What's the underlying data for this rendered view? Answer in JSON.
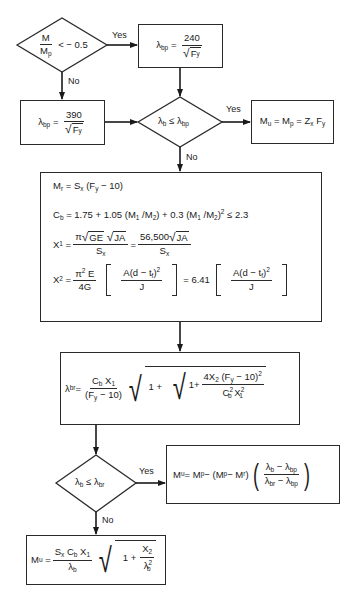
{
  "decisions": {
    "d1": {
      "lhs_num": "M",
      "lhs_den": "M",
      "lhs_den_sub": "p",
      "op": "< − 0.5",
      "yes": "Yes",
      "no": "No"
    },
    "d2": {
      "lhs": "λ",
      "lhs_sub": "b",
      "op": "≤",
      "rhs": "λ",
      "rhs_sub": "bp",
      "yes": "Yes",
      "no": "No"
    },
    "d3": {
      "lhs": "λ",
      "lhs_sub": "b",
      "op": "≤",
      "rhs": "λ",
      "rhs_sub": "br",
      "yes": "Yes",
      "no": "No"
    }
  },
  "boxes": {
    "lambda_bp_240": {
      "lhs": "λ",
      "lhs_sub": "bp",
      "eq": "=",
      "num": "240",
      "den_var": "F",
      "den_sub": "y"
    },
    "lambda_bp_390": {
      "lhs": "λ",
      "lhs_sub": "bp",
      "eq": "=",
      "num": "390",
      "den_var": "F",
      "den_sub": "y"
    },
    "mu_mp": {
      "text_a": "M",
      "sub_a": "u",
      "text_b": " = M",
      "sub_b": "p",
      "text_c": " = Z",
      "sub_c": "x",
      "text_d": " F",
      "sub_d": "y"
    },
    "big": {
      "mr": {
        "a": "M",
        "a_sub": "r",
        "b": " = S",
        "b_sub": "x",
        "c": "  (F",
        "c_sub": "y",
        "d": " − 10)"
      },
      "cb": {
        "a": "C",
        "a_sub": "b",
        "b": " = 1.75 + 1.05 (M",
        "s1": "1",
        "c": " /M",
        "s2": "2",
        "d": ") + 0.3 (M",
        "s3": "1",
        "e": " /M",
        "s4": "2",
        "f": ")",
        "sup": "2",
        "g": "  ≤  2.3"
      },
      "x1": {
        "lhs": "X",
        "lhs_sub": "1",
        "eq": "=",
        "num_pi": "π",
        "num_r1": "GE",
        "num_r2": "JA",
        "den": "S",
        "den_sub": "x",
        "eq2": "=",
        "num2": "56,500",
        "num2_r": "JA",
        "den2": "S",
        "den2_sub": "x"
      },
      "x2": {
        "lhs": "X",
        "lhs_sub": "2",
        "eq": "=",
        "num": "π",
        "num_sup": "2",
        "num_b": " E",
        "den": "4G",
        "inner_num_a": "A(d − t",
        "inner_num_sub": "f",
        "inner_num_b": ")",
        "inner_num_sup": "2",
        "inner_den": "J",
        "eq2": "= 6.41"
      }
    },
    "lambda_br": {
      "lhs": "λ",
      "lhs_sub": "br",
      "eq": "=",
      "num": "C",
      "num_sub": "b",
      "num_b": " X",
      "num_sub2": "1",
      "den": "(F",
      "den_sub": "y",
      "den_b": " − 10)",
      "one_plus": "1 +",
      "one_plus2": "1+",
      "in_num_a": "4X",
      "in_num_sub": "2",
      "in_num_b": " (F",
      "in_num_sub2": "y",
      "in_num_c": " − 10)",
      "in_num_sup": "2",
      "in_den_a": "C",
      "in_den_sup": "2",
      "in_den_sub": "b",
      "in_den_b": " X",
      "in_den_sup2": "2",
      "in_den_sub2": "1"
    },
    "mu_interp": {
      "a": "M",
      "a_sub": "u",
      "b": " = M",
      "b_sub": "p",
      "c": " − (M",
      "c_sub": "p",
      "d": " − M",
      "d_sub": "r",
      "e": ")",
      "num_a": "λ",
      "num_sub": "b",
      "num_b": " − λ",
      "num_sub2": "bp",
      "den_a": "λ",
      "den_sub": "br",
      "den_b": " − λ",
      "den_sub2": "bp"
    },
    "mu_final": {
      "a": "M",
      "a_sub": "u",
      "eq": "=",
      "num_a": "S",
      "num_sub": "x",
      "num_b": " C",
      "num_sub2": "b",
      "num_c": " X",
      "num_sub3": "1",
      "den": "λ",
      "den_sub": "b",
      "one_plus": "1 +",
      "in_num": "X",
      "in_num_sub": "2",
      "in_den": "λ",
      "in_den_sup": "2",
      "in_den_sub": "b"
    }
  }
}
